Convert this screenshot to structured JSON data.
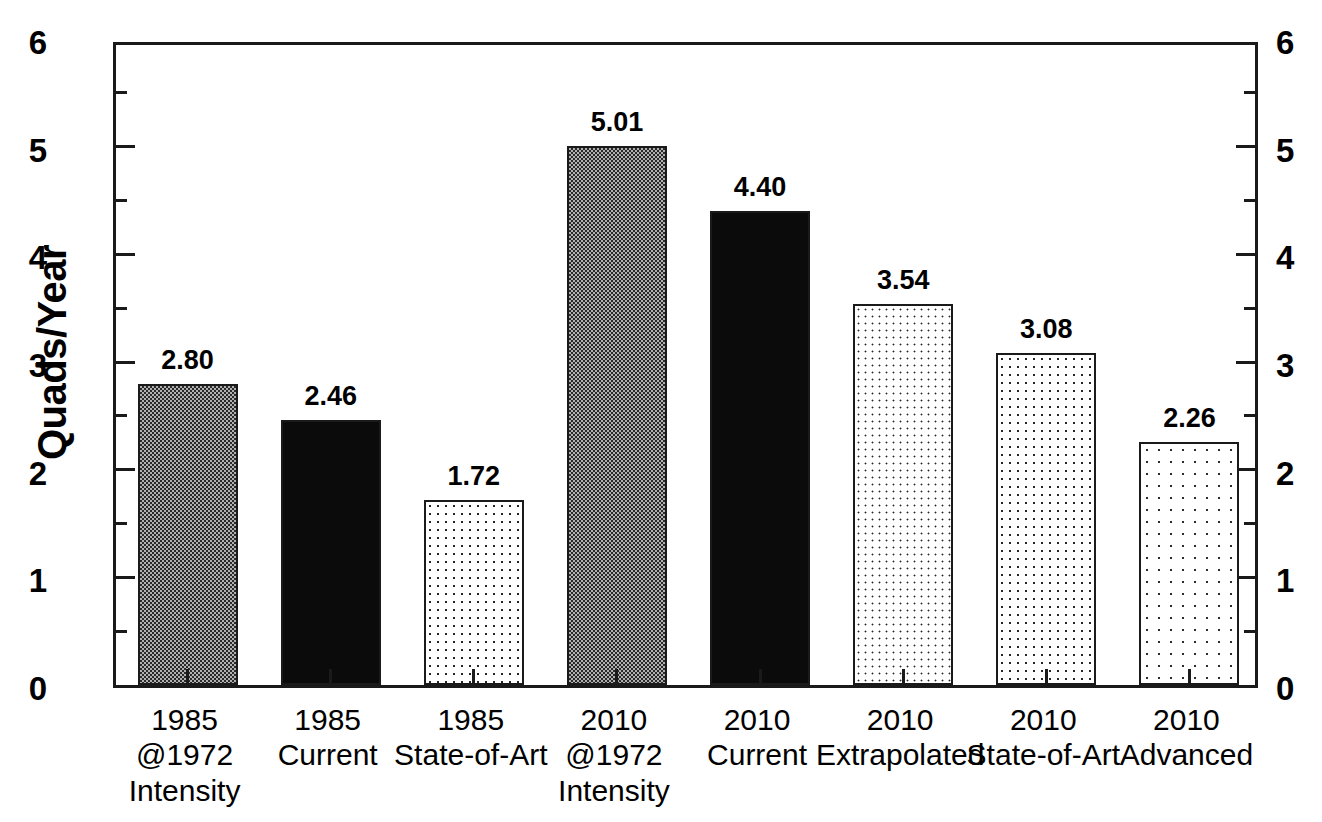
{
  "chart_data": {
    "type": "bar",
    "title": "",
    "xlabel": "",
    "ylabel": "Quads/Year",
    "ylim": [
      0,
      6
    ],
    "y_ticks": [
      "0",
      "1",
      "2",
      "3",
      "4",
      "5",
      "6"
    ],
    "y_minor_step": 0.5,
    "grid": false,
    "legend": "none",
    "dual_axis": true,
    "right_axis_ticks": [
      "0",
      "1",
      "2",
      "3",
      "4",
      "5",
      "6"
    ],
    "categories": [
      "1985 @1972 Intensity",
      "1985 Current",
      "1985 State-of-Art",
      "2010 @1972 Intensity",
      "2010 Current",
      "2010 Extrapolated",
      "2010 State-of-Art",
      "2010 Advanced"
    ],
    "values": [
      2.8,
      2.46,
      1.72,
      5.01,
      4.4,
      3.54,
      3.08,
      2.26
    ],
    "value_labels": [
      "2.80",
      "2.46",
      "1.72",
      "5.01",
      "4.40",
      "3.54",
      "3.08",
      "2.26"
    ],
    "bars": [
      {
        "value": 2.8,
        "label": "2.80",
        "pattern": "checkerboard-gray",
        "lines": [
          "1985",
          "@1972",
          "Intensity"
        ]
      },
      {
        "value": 2.46,
        "label": "2.46",
        "pattern": "solid-black",
        "lines": [
          "1985",
          "Current"
        ]
      },
      {
        "value": 1.72,
        "label": "1.72",
        "pattern": "dots-light",
        "lines": [
          "1985",
          "State-of-Art"
        ]
      },
      {
        "value": 5.01,
        "label": "5.01",
        "pattern": "checkerboard-gray",
        "lines": [
          "2010",
          "@1972",
          "Intensity"
        ]
      },
      {
        "value": 4.4,
        "label": "4.40",
        "pattern": "solid-black",
        "lines": [
          "2010",
          "Current"
        ]
      },
      {
        "value": 3.54,
        "label": "3.54",
        "pattern": "dots-medium",
        "lines": [
          "2010",
          "Extrapolated"
        ]
      },
      {
        "value": 3.08,
        "label": "3.08",
        "pattern": "dots-light",
        "lines": [
          "2010",
          "State-of-Art"
        ]
      },
      {
        "value": 2.26,
        "label": "2.26",
        "pattern": "dots-sparse",
        "lines": [
          "2010",
          "Advanced"
        ]
      }
    ],
    "colors": {
      "axis": "#1a1a1a",
      "text": "#000000",
      "background": "#ffffff",
      "bar_gray": "#b0b0b0",
      "bar_black": "#0b0b0b",
      "bar_light": "#ffffff"
    }
  }
}
